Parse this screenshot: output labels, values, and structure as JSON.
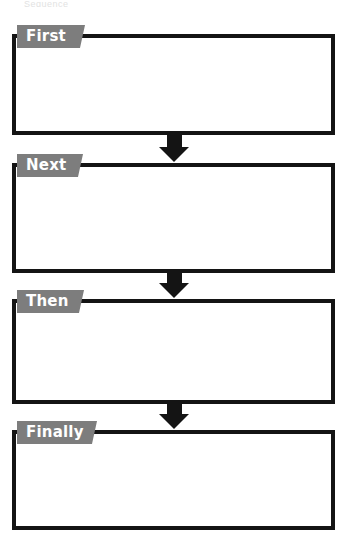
{
  "document": {
    "title": "Sequencing Graphic Organizer",
    "type": "worksheet",
    "top_partial_text": "Sequence",
    "colors": {
      "box_border": "#141414",
      "label_background": "#7d7d7d",
      "label_text": "#ffffff",
      "arrow": "#141414",
      "page_background": "#ffffff"
    }
  },
  "steps": [
    {
      "label": "First",
      "content": "",
      "order": 1
    },
    {
      "label": "Next",
      "content": "",
      "order": 2
    },
    {
      "label": "Then",
      "content": "",
      "order": 3
    },
    {
      "label": "Finally",
      "content": "",
      "order": 4
    }
  ],
  "connectors": [
    {
      "from": "First",
      "to": "Next",
      "icon": "down-arrow-icon"
    },
    {
      "from": "Next",
      "to": "Then",
      "icon": "down-arrow-icon"
    },
    {
      "from": "Then",
      "to": "Finally",
      "icon": "down-arrow-icon"
    }
  ]
}
